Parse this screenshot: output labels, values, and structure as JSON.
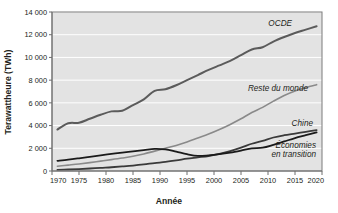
{
  "chart_data": {
    "type": "line",
    "title": "",
    "xlabel": "Année",
    "ylabel": "Terawattheure (TWh)",
    "xlim": [
      1970,
      2020
    ],
    "ylim": [
      0,
      14000
    ],
    "xticks": [
      "1970",
      "1975",
      "1980",
      "1985",
      "1990",
      "1995",
      "2000",
      "2005",
      "2010",
      "2015",
      "2020"
    ],
    "yticks": [
      "0",
      "2 000",
      "4 000",
      "6 000",
      "8 000",
      "10 000",
      "12 000",
      "14 000"
    ],
    "grid": "horizontal",
    "legend_position": "inline-right-of-curves",
    "x": [
      1971,
      1973,
      1975,
      1977,
      1979,
      1981,
      1983,
      1985,
      1987,
      1989,
      1991,
      1993,
      1995,
      1997,
      1999,
      2001,
      2003,
      2005,
      2007,
      2009,
      2011,
      2013,
      2015,
      2017,
      2019
    ],
    "series": [
      {
        "name": "OCDE",
        "label": "OCDE",
        "color": "#5b5b5b",
        "width": 2.0,
        "values": [
          3650,
          4200,
          4250,
          4600,
          4950,
          5250,
          5300,
          5800,
          6300,
          7050,
          7200,
          7550,
          8000,
          8450,
          8900,
          9300,
          9700,
          10200,
          10700,
          10900,
          11400,
          11800,
          12150,
          12450,
          12750
        ]
      },
      {
        "name": "Reste du monde",
        "label": "Reste du monde",
        "color": "#8a8a8a",
        "width": 1.6,
        "values": [
          420,
          520,
          620,
          740,
          870,
          1000,
          1140,
          1300,
          1500,
          1750,
          2000,
          2250,
          2550,
          2900,
          3250,
          3650,
          4100,
          4600,
          5150,
          5600,
          6150,
          6650,
          7050,
          7350,
          7600
        ]
      },
      {
        "name": "Chine",
        "label": "Chine",
        "color": "#3a3a3a",
        "width": 1.8,
        "values": [
          100,
          130,
          170,
          220,
          280,
          330,
          400,
          480,
          580,
          700,
          800,
          930,
          1080,
          1200,
          1320,
          1500,
          1750,
          2050,
          2400,
          2650,
          2950,
          3150,
          3300,
          3450,
          3600
        ]
      },
      {
        "name": "Économies en transition",
        "label": "Économies\nen transition",
        "color": "#1a1a1a",
        "width": 1.8,
        "values": [
          900,
          1000,
          1120,
          1250,
          1380,
          1500,
          1620,
          1720,
          1830,
          1950,
          1900,
          1700,
          1480,
          1330,
          1380,
          1480,
          1620,
          1800,
          2000,
          2050,
          2300,
          2600,
          2900,
          3150,
          3400
        ]
      }
    ],
    "annotations": [
      {
        "text": "OCDE",
        "series": "OCDE",
        "x_px": 292,
        "y_px": 26,
        "anchor": "end"
      },
      {
        "text": "Reste du monde",
        "series": "Reste du monde",
        "x_px": 308,
        "y_px": 91,
        "anchor": "end"
      },
      {
        "text": "Chine",
        "series": "Chine",
        "x_px": 313,
        "y_px": 126,
        "anchor": "end"
      },
      {
        "text": "Économies",
        "series": "Économies en transition",
        "x_px": 316,
        "y_px": 148,
        "anchor": "end"
      },
      {
        "text": "en transition",
        "series": "Économies en transition",
        "x_px": 316,
        "y_px": 157,
        "anchor": "end"
      }
    ]
  },
  "plot": {
    "left_px": 52,
    "right_px": 322,
    "top_px": 12,
    "bottom_px": 171
  }
}
